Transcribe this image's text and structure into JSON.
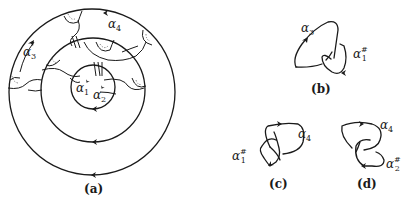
{
  "figure": {
    "panels": [
      {
        "id": "a",
        "caption": "(a)",
        "labels": [
          {
            "base": "α",
            "sub": "3",
            "sup": ""
          },
          {
            "base": "α",
            "sub": "4",
            "sup": ""
          },
          {
            "base": "α",
            "sub": "1",
            "sup": ""
          },
          {
            "base": "α",
            "sub": "2",
            "sup": ""
          }
        ],
        "description": "Three concentric oriented circles with knotted arcs and dotted disk regions"
      },
      {
        "id": "b",
        "caption": "(b)",
        "labels": [
          {
            "base": "α",
            "sub": "3",
            "sup": ""
          },
          {
            "base": "α",
            "sub": "1",
            "sup": "#"
          }
        ]
      },
      {
        "id": "c",
        "caption": "(c)",
        "labels": [
          {
            "base": "α",
            "sub": "4",
            "sup": ""
          },
          {
            "base": "α",
            "sub": "1",
            "sup": "#"
          }
        ]
      },
      {
        "id": "d",
        "caption": "(d)",
        "labels": [
          {
            "base": "α",
            "sub": "4",
            "sup": ""
          },
          {
            "base": "α",
            "sub": "2",
            "sup": "#"
          }
        ]
      }
    ],
    "colors": {
      "ink": "#1a1a1a",
      "background": "#ffffff"
    }
  }
}
